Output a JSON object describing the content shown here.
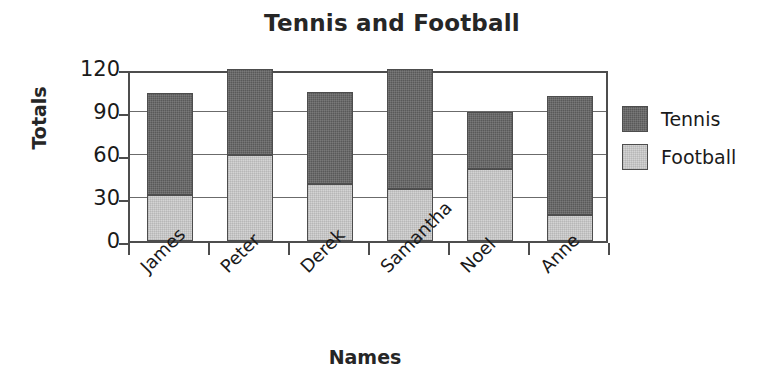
{
  "chart_data": {
    "type": "bar",
    "subtype": "stacked-bar",
    "title": "Tennis and Football",
    "xlabel": "Names",
    "ylabel": "Totals",
    "categories": [
      "James",
      "Peter",
      "Derek",
      "Samantha",
      "Noel",
      "Anne"
    ],
    "series": [
      {
        "name": "Tennis",
        "color": "#595959",
        "values": [
          71,
          60,
          64,
          84,
          40,
          83
        ]
      },
      {
        "name": "Football",
        "color": "#d4d4d4",
        "values": [
          32,
          60,
          40,
          36,
          50,
          18
        ]
      }
    ],
    "stack_totals": [
      103,
      120,
      104,
      120,
      90,
      101
    ],
    "ylim": [
      0,
      120
    ],
    "yticks": [
      0,
      30,
      60,
      90,
      120
    ],
    "ytick_labels": [
      "0",
      "30",
      "60",
      "90",
      "120"
    ],
    "grid": true,
    "grid_axis": "y",
    "legend_position": "right",
    "xtick_label_rotation": -45
  },
  "legend": {
    "items": [
      {
        "label": "Tennis",
        "color": "#595959"
      },
      {
        "label": "Football",
        "color": "#d4d4d4"
      }
    ]
  },
  "axis": {
    "y_title": "Totals",
    "x_title": "Names",
    "y_tick_0": "0",
    "y_tick_1": "30",
    "y_tick_2": "60",
    "y_tick_3": "90",
    "y_tick_4": "120"
  },
  "xticks": {
    "t0": "James",
    "t1": "Peter",
    "t2": "Derek",
    "t3": "Samantha",
    "t4": "Noel",
    "t5": "Anne"
  },
  "colors": {
    "tennis": "#595959",
    "football": "#d4d4d4",
    "axis": "#4d4d4d",
    "grid": "#6b6b6b",
    "text": "#1a1a1a"
  }
}
